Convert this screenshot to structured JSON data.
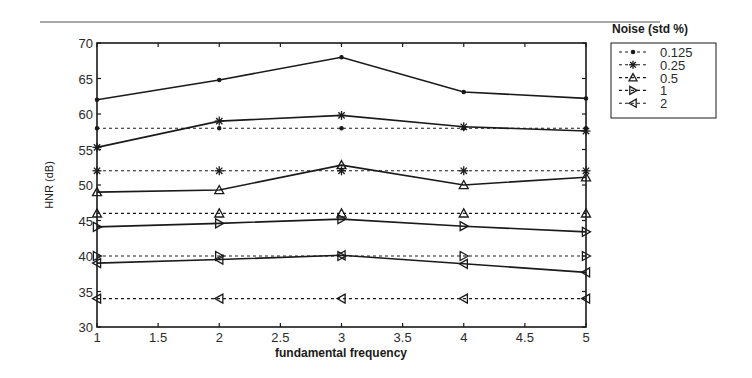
{
  "chart_data": {
    "type": "line",
    "title": "",
    "xlabel": "fundamental frequency",
    "ylabel": "HNR (dB)",
    "xlim": [
      1,
      5
    ],
    "ylim": [
      30,
      70
    ],
    "x_ticks": [
      1,
      1.5,
      2,
      2.5,
      3,
      3.5,
      4,
      4.5,
      5
    ],
    "x_tick_labels": [
      "1",
      "1.5",
      "2",
      "2.5",
      "3",
      "3.5",
      "4",
      "4.5",
      "5"
    ],
    "y_ticks": [
      30,
      35,
      40,
      45,
      50,
      55,
      60,
      65,
      70
    ],
    "y_tick_labels": [
      "30",
      "35",
      "40",
      "45",
      "50",
      "55",
      "60",
      "65",
      "70"
    ],
    "grid": false,
    "legend_title": "Noise (std %)",
    "legend_position": "outside-upper-right",
    "x": [
      1,
      2,
      3,
      4,
      5
    ],
    "series": [
      {
        "name": "0.125",
        "marker": "dot",
        "style": "dashed",
        "role": "expected",
        "values": [
          58,
          58,
          58,
          58,
          58
        ]
      },
      {
        "name": "0.25",
        "marker": "asterisk",
        "style": "dashed",
        "role": "expected",
        "values": [
          52,
          52,
          52,
          52,
          52
        ]
      },
      {
        "name": "0.5",
        "marker": "triangle-up",
        "style": "dashed",
        "role": "expected",
        "values": [
          46,
          46,
          46,
          46,
          46
        ]
      },
      {
        "name": "1",
        "marker": "triangle-right",
        "style": "dashed",
        "role": "expected",
        "values": [
          40,
          40,
          40,
          40,
          40
        ]
      },
      {
        "name": "2",
        "marker": "triangle-left",
        "style": "dashed",
        "role": "expected",
        "values": [
          34,
          34,
          34,
          34,
          34
        ]
      },
      {
        "name": "0.125",
        "marker": "dot",
        "style": "solid",
        "role": "measured",
        "values": [
          62.0,
          64.8,
          68.0,
          63.1,
          62.2
        ]
      },
      {
        "name": "0.25",
        "marker": "asterisk",
        "style": "solid",
        "role": "measured",
        "values": [
          55.3,
          59.0,
          59.8,
          58.2,
          57.6
        ]
      },
      {
        "name": "0.5",
        "marker": "triangle-up",
        "style": "solid",
        "role": "measured",
        "values": [
          49.0,
          49.3,
          52.8,
          50.0,
          51.1
        ]
      },
      {
        "name": "1",
        "marker": "triangle-right",
        "style": "solid",
        "role": "measured",
        "values": [
          44.1,
          44.6,
          45.2,
          44.2,
          43.4
        ]
      },
      {
        "name": "2",
        "marker": "triangle-left",
        "style": "solid",
        "role": "measured",
        "values": [
          39.0,
          39.5,
          40.1,
          38.9,
          37.7
        ]
      }
    ],
    "legend_entries": [
      {
        "label": "0.125",
        "marker": "dot"
      },
      {
        "label": "0.25",
        "marker": "asterisk"
      },
      {
        "label": "0.5",
        "marker": "triangle-up"
      },
      {
        "label": "1",
        "marker": "triangle-right"
      },
      {
        "label": "2",
        "marker": "triangle-left"
      }
    ]
  },
  "colors": {
    "line": "#1a1a1a",
    "axis": "#1a1a1a",
    "background": "#ffffff"
  }
}
